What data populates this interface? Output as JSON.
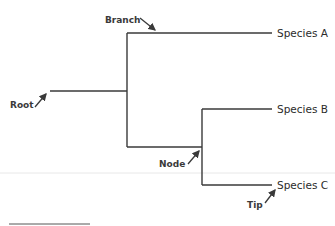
{
  "diagram": {
    "type": "phylogenetic-tree",
    "species": [
      {
        "label": "Species A"
      },
      {
        "label": "Species B"
      },
      {
        "label": "Species C"
      }
    ],
    "annotations": {
      "root": "Root",
      "branch": "Branch",
      "node": "Node",
      "tip": "Tip"
    },
    "colors": {
      "line": "#3a3a3a",
      "separator": "#e6e6e6"
    }
  }
}
